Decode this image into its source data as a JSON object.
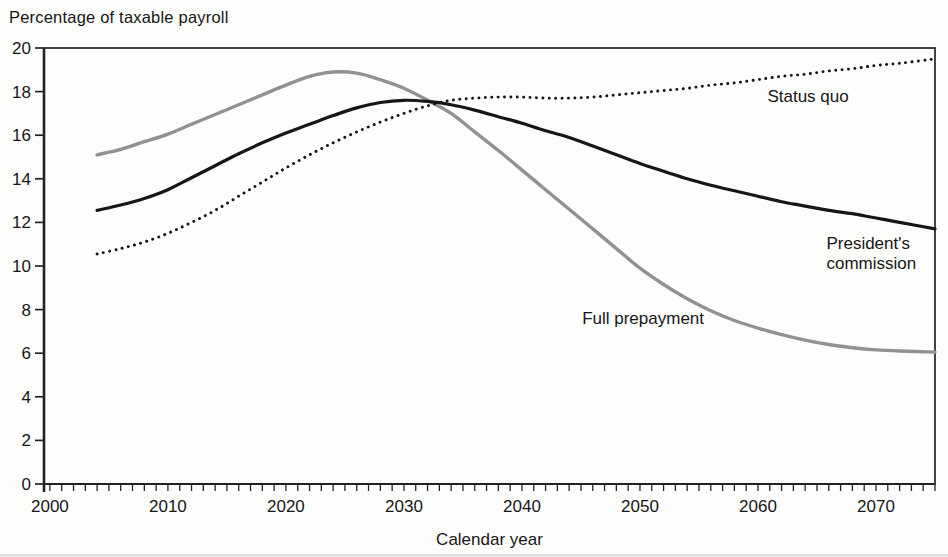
{
  "chart_data": {
    "type": "line",
    "title": "Percentage of taxable payroll",
    "xlabel": "Calendar year",
    "ylabel": "",
    "xlim": [
      1999.5,
      2075
    ],
    "ylim": [
      0,
      20
    ],
    "x_major_ticks": [
      2000,
      2010,
      2020,
      2030,
      2040,
      2050,
      2060,
      2070
    ],
    "x_minor_tick_start": 2000,
    "x_minor_tick_end": 2075,
    "x_minor_tick_step": 1,
    "y_ticks": [
      0,
      2,
      4,
      6,
      8,
      10,
      12,
      14,
      16,
      18,
      20
    ],
    "grid": false,
    "legend": "inline-labels",
    "axis_color": "#222222",
    "text_color": "#161616",
    "x": [
      2004,
      2006,
      2008,
      2010,
      2012,
      2014,
      2016,
      2018,
      2020,
      2022,
      2024,
      2026,
      2028,
      2030,
      2032,
      2034,
      2036,
      2038,
      2040,
      2042,
      2044,
      2046,
      2048,
      2050,
      2052,
      2054,
      2056,
      2058,
      2060,
      2062,
      2064,
      2066,
      2068,
      2070,
      2072,
      2075
    ],
    "series": [
      {
        "name": "Status quo",
        "style": "dotted",
        "color": "#161616",
        "label_lines": [
          "Status quo"
        ],
        "label_pos": {
          "year": 2060.8,
          "value": 17.52,
          "anchor": "start"
        },
        "values": [
          10.55,
          10.8,
          11.1,
          11.5,
          12.0,
          12.55,
          13.2,
          13.85,
          14.5,
          15.1,
          15.65,
          16.15,
          16.6,
          17.0,
          17.35,
          17.6,
          17.7,
          17.75,
          17.75,
          17.7,
          17.7,
          17.75,
          17.85,
          17.95,
          18.05,
          18.15,
          18.3,
          18.4,
          18.55,
          18.7,
          18.8,
          18.95,
          19.05,
          19.2,
          19.3,
          19.5
        ]
      },
      {
        "name": "President's commission",
        "style": "solid",
        "color": "#161616",
        "label_lines": [
          "President's",
          "commission"
        ],
        "label_pos": {
          "year": 2065.8,
          "value": 10.8,
          "anchor": "start"
        },
        "values": [
          12.55,
          12.8,
          13.1,
          13.5,
          14.05,
          14.6,
          15.15,
          15.65,
          16.1,
          16.5,
          16.9,
          17.25,
          17.5,
          17.6,
          17.55,
          17.4,
          17.15,
          16.85,
          16.55,
          16.2,
          15.9,
          15.5,
          15.1,
          14.7,
          14.35,
          14.0,
          13.7,
          13.45,
          13.2,
          12.95,
          12.75,
          12.55,
          12.4,
          12.2,
          12.0,
          11.7
        ]
      },
      {
        "name": "Full prepayment",
        "style": "solid",
        "color": "#919191",
        "label_lines": [
          "Full prepayment"
        ],
        "label_pos": {
          "year": 2045.1,
          "value": 7.35,
          "anchor": "start"
        },
        "values": [
          15.1,
          15.35,
          15.7,
          16.05,
          16.5,
          16.95,
          17.4,
          17.85,
          18.3,
          18.7,
          18.9,
          18.85,
          18.55,
          18.15,
          17.6,
          17.0,
          16.15,
          15.3,
          14.4,
          13.5,
          12.6,
          11.7,
          10.8,
          9.9,
          9.15,
          8.5,
          7.95,
          7.5,
          7.15,
          6.85,
          6.6,
          6.4,
          6.25,
          6.15,
          6.1,
          6.05
        ]
      }
    ]
  }
}
